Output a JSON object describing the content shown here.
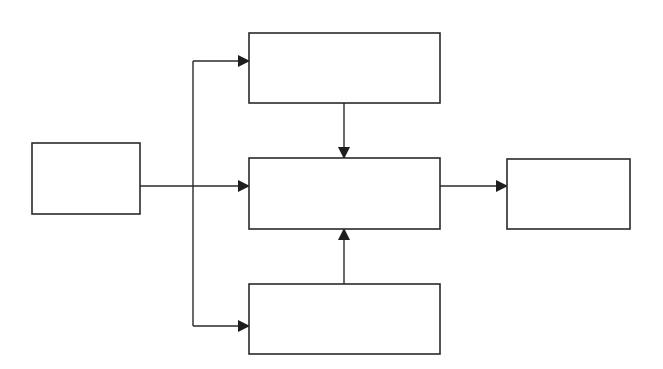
{
  "diagram": {
    "type": "block-flow",
    "colors": {
      "stroke": "#2a2a2a",
      "fill": "#ffffff",
      "background": "#ffffff"
    },
    "nodes": [
      {
        "id": "input",
        "label": "",
        "x": 32,
        "y": 143,
        "w": 108,
        "h": 71
      },
      {
        "id": "top",
        "label": "",
        "x": 249,
        "y": 33,
        "w": 191,
        "h": 70
      },
      {
        "id": "center",
        "label": "",
        "x": 249,
        "y": 158,
        "w": 191,
        "h": 71
      },
      {
        "id": "bottom",
        "label": "",
        "x": 249,
        "y": 284,
        "w": 191,
        "h": 70
      },
      {
        "id": "output",
        "label": "",
        "x": 507,
        "y": 159,
        "w": 123,
        "h": 70
      }
    ],
    "edges": [
      {
        "from": "input",
        "to": "top"
      },
      {
        "from": "input",
        "to": "center"
      },
      {
        "from": "input",
        "to": "bottom"
      },
      {
        "from": "top",
        "to": "center"
      },
      {
        "from": "bottom",
        "to": "center"
      },
      {
        "from": "center",
        "to": "output"
      }
    ]
  }
}
